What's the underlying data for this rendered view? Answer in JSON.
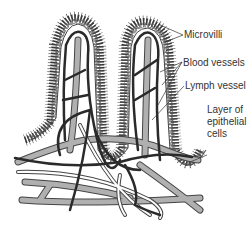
{
  "diagram": {
    "labels": {
      "microvilli": "Microvilli",
      "blood_vessels": "Blood vessels",
      "lymph_vessel": "Lymph vessel",
      "epithelial_line1": "Layer of",
      "epithelial_line2": "epithelial",
      "epithelial_line3": "cells"
    },
    "colors": {
      "blood_vessel": "#2a2a2a",
      "lymph_vessel": "#a8a8a8",
      "outline": "#3a3a3a",
      "background": "#ffffff"
    }
  }
}
